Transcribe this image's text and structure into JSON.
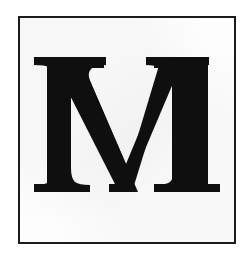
{
  "image": {
    "kind": "scanned-letter-plate",
    "subject_character": "M",
    "description": "Large bold serif capital letter M centered inside a thin ruled rectangular border on an off-white scanned page.",
    "typeface_style": "bold serif (Times-like) capital",
    "width_px": 250,
    "height_px": 260
  },
  "colors": {
    "page_background": "#ffffff",
    "plate_background": "#fdfdfd",
    "frame_stroke": "#1b1b1b",
    "ink": "#100f0f"
  },
  "frame": {
    "name": "plate-border",
    "left_px": 18,
    "top_px": 16,
    "width_px": 218,
    "height_px": 228,
    "stroke_width_px": 2
  },
  "glyph": {
    "character": "M",
    "label": "M",
    "cap_top_px": 55,
    "baseline_px": 190,
    "left_serif_span_px": [
      32,
      78
    ],
    "right_serif_span_px": [
      152,
      218
    ],
    "apex_span_px": [
      107,
      122
    ],
    "top_left_serif_span_px": [
      47,
      102
    ],
    "top_right_serif_span_px": [
      152,
      205
    ]
  }
}
